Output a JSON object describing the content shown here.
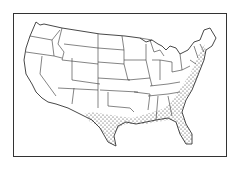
{
  "map": {
    "subject": "contiguous United States",
    "style": "black-and-white line drawing with state boundaries",
    "highlighted_region": {
      "description": "stippled coastal plain along the Gulf of Mexico and Atlantic seaboard",
      "pattern": "dots",
      "areas": [
        "Gulf coast of Texas",
        "Louisiana",
        "Mississippi",
        "Alabama",
        "Georgia",
        "Florida",
        "South Carolina",
        "North Carolina",
        "Virginia",
        "Maryland",
        "Delaware",
        "New Jersey",
        "coastal New York",
        "Connecticut",
        "Rhode Island",
        "Massachusetts"
      ]
    },
    "colors": {
      "line": "#333333",
      "background": "#ffffff",
      "stipple": "#333333"
    }
  }
}
